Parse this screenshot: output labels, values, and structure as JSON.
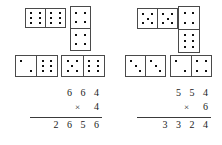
{
  "worksheet": {
    "title": "Domino multiplication worksheet",
    "groups": [
      {
        "id": "left-group",
        "name": "left-problem",
        "dominoes": [
          {
            "name": "domino-6-6",
            "orientation": "horizontal",
            "halves": [
              6,
              6
            ]
          },
          {
            "name": "domino-4-4",
            "orientation": "vertical",
            "halves": [
              4,
              4
            ]
          },
          {
            "name": "domino-2-6",
            "orientation": "horizontal",
            "halves": [
              2,
              6
            ]
          },
          {
            "name": "domino-5-6",
            "orientation": "horizontal",
            "halves": [
              5,
              6
            ]
          }
        ],
        "problem": {
          "multiplicand": "6 6 4",
          "operator": "×",
          "multiplier": "4",
          "product": "2 6 5 6"
        }
      },
      {
        "id": "right-group",
        "name": "right-problem",
        "dominoes": [
          {
            "name": "domino-5-5",
            "orientation": "horizontal",
            "halves": [
              5,
              5
            ]
          },
          {
            "name": "domino-4-6",
            "orientation": "vertical",
            "halves": [
              4,
              6
            ]
          },
          {
            "name": "domino-3-3",
            "orientation": "horizontal",
            "halves": [
              3,
              3
            ]
          },
          {
            "name": "domino-2-4",
            "orientation": "horizontal",
            "halves": [
              2,
              4
            ]
          }
        ],
        "problem": {
          "multiplicand": "5 5 4",
          "operator": "×",
          "multiplier": "6",
          "product": "3 3 2 4"
        }
      }
    ],
    "colors": {
      "page_background": "#ffffff",
      "domino_border": "#4a4a4a",
      "pip": "#111111",
      "text": "#1a1a1a"
    }
  }
}
